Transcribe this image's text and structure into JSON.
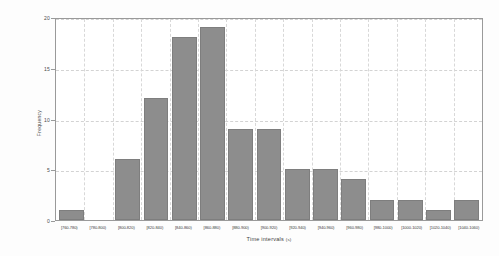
{
  "chart_data": {
    "type": "bar",
    "title": "",
    "xlabel": "Time intervals",
    "xlabel_unit": "(s)",
    "ylabel": "Frequency",
    "ylim": [
      0,
      20
    ],
    "yticks": [
      0,
      5,
      10,
      15,
      20
    ],
    "grid": true,
    "legend": null,
    "bar_color": "#8d8d8d",
    "categories": [
      "[760-780)",
      "[780-800)",
      "[800-820)",
      "[820-840)",
      "[840-860)",
      "[860-880)",
      "[880-900)",
      "[900-920)",
      "[920-940)",
      "[940-960)",
      "[960-980)",
      "[980-1000)",
      "[1000-1020)",
      "[1020-1040)",
      "[1040-1060)"
    ],
    "values": [
      1,
      0,
      6,
      12,
      18,
      19,
      9,
      9,
      5,
      5,
      4,
      2,
      2,
      1,
      2
    ]
  }
}
